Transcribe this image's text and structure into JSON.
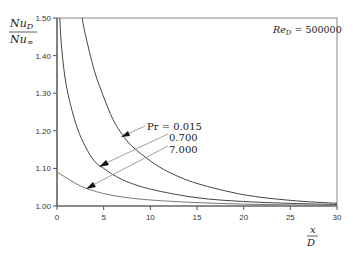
{
  "chart_data": {
    "type": "line",
    "title": "",
    "annotation": "Re_D = 500000",
    "xlabel": "x/D",
    "ylabel": "Nu_D / Nu_inf",
    "xlim": [
      0,
      30
    ],
    "ylim": [
      1.0,
      1.5
    ],
    "xticks": [
      0,
      5,
      10,
      15,
      20,
      25,
      30
    ],
    "xtick_labels": [
      "0",
      "5",
      "10",
      "15",
      "20",
      "25",
      "30"
    ],
    "yticks": [
      1.0,
      1.1,
      1.2,
      1.3,
      1.4,
      1.5
    ],
    "ytick_labels": [
      "1.00",
      "1.10",
      "1.20",
      "1.30",
      "1.40",
      "1.50"
    ],
    "grid": false,
    "legend": "inline arrow labels",
    "series": [
      {
        "name": "Pr = 0.015",
        "label": "Pr = 0.015",
        "x": [
          2.7,
          3,
          4,
          5,
          6,
          7,
          8,
          10,
          12,
          15,
          20,
          25,
          30
        ],
        "y": [
          1.5,
          1.46,
          1.36,
          1.29,
          1.23,
          1.19,
          1.16,
          1.12,
          1.09,
          1.06,
          1.03,
          1.015,
          1.007
        ]
      },
      {
        "name": "Pr = 0.700",
        "label": "0.700",
        "x": [
          0.3,
          0.5,
          1,
          2,
          3,
          4,
          5,
          7,
          10,
          15,
          20,
          25,
          30
        ],
        "y": [
          1.5,
          1.42,
          1.32,
          1.22,
          1.16,
          1.12,
          1.1,
          1.07,
          1.045,
          1.022,
          1.012,
          1.007,
          1.004
        ]
      },
      {
        "name": "Pr = 7.000",
        "label": "7.000",
        "x": [
          0,
          1,
          2,
          3,
          4,
          5,
          7,
          10,
          15,
          20,
          25,
          30
        ],
        "y": [
          1.09,
          1.075,
          1.06,
          1.048,
          1.04,
          1.033,
          1.024,
          1.016,
          1.009,
          1.005,
          1.003,
          1.002
        ]
      }
    ]
  },
  "labels": {
    "ylabel_num": "Nu",
    "ylabel_num_sub": "D",
    "ylabel_den": "Nu",
    "ylabel_den_sub": "∞",
    "xlabel_num": "x",
    "xlabel_den": "D",
    "re_main": "Re",
    "re_sub": "D",
    "re_value": " = 500000",
    "pr_label_1": "Pr = 0.015",
    "pr_label_2": "0.700",
    "pr_label_3": "7.000"
  },
  "colors": {
    "axis": "#555555",
    "curve": "#444444",
    "leader": "#888888"
  }
}
